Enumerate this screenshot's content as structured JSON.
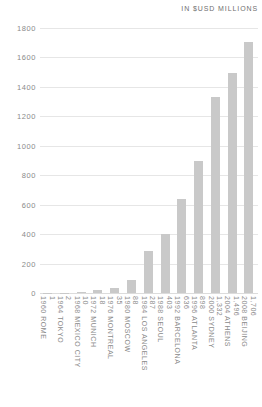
{
  "header": {
    "unit_note": "IN $USD MILLIONS"
  },
  "chart_data": {
    "type": "bar",
    "title": "",
    "subtitle": "",
    "xlabel": "",
    "ylabel": "IN $USD MILLIONS",
    "ylim": [
      0,
      1800
    ],
    "grid": true,
    "legend": "none",
    "yticks": [
      0,
      200,
      400,
      600,
      800,
      1000,
      1200,
      1400,
      1600,
      1800
    ],
    "ytick_labels": [
      "0",
      "200",
      "400",
      "600",
      "800",
      "1000",
      "1200",
      "1400",
      "1600",
      "1800"
    ],
    "categories": [
      "1960 ROME",
      "1964 TOKYO",
      "1968 MEXICO CITY",
      "1972 MUNICH",
      "1976 MONTREAL",
      "1980 MOSCOW",
      "1984 LOS ANGELES",
      "1988 SEOUL",
      "1992 BARCELONA",
      "1996 ATLANTA",
      "2000 SYDNEY",
      "2004 ATHENS",
      "2008 BEIJING"
    ],
    "values": [
      1,
      2,
      10,
      18,
      35,
      88,
      287,
      403,
      636,
      898,
      1332,
      1496,
      1706
    ],
    "value_labels": [
      "1",
      "2",
      "10",
      "18",
      "35",
      "88",
      "287",
      "403",
      "636",
      "898",
      "1,332",
      "1,496",
      "1,706"
    ],
    "bar_color": "#c9c9c9",
    "grid_color": "#e6e6e6",
    "text_color": "#8a8a8a"
  }
}
